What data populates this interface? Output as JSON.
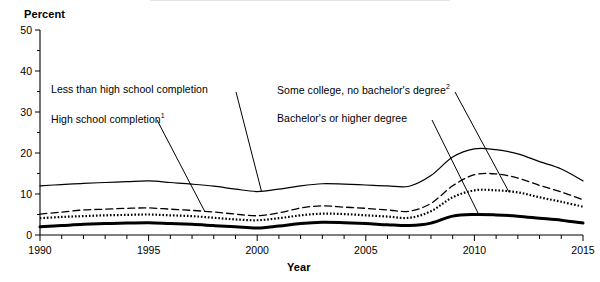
{
  "chart_data": {
    "type": "line",
    "title": "",
    "xlabel": "Year",
    "ylabel": "Percent",
    "ylim": [
      0,
      50
    ],
    "xlim": [
      1990,
      2015
    ],
    "yticks": [
      0,
      10,
      20,
      30,
      40,
      50
    ],
    "ytick_labels": [
      "0",
      "10",
      "20",
      "30",
      "40",
      "50"
    ],
    "yminor_step": 5,
    "xticks": [
      1990,
      1995,
      2000,
      2005,
      2010,
      2015
    ],
    "xtick_labels": [
      "1990",
      "1995",
      "2000",
      "2005",
      "2010",
      "2015"
    ],
    "xtick_step": 1,
    "grid": false,
    "legend": "inline-annotations",
    "x": [
      1990,
      1991,
      1992,
      1993,
      1994,
      1995,
      1996,
      1997,
      1998,
      1999,
      2000,
      2001,
      2002,
      2003,
      2004,
      2005,
      2006,
      2007,
      2008,
      2009,
      2010,
      2011,
      2012,
      2013,
      2014,
      2015
    ],
    "series": [
      {
        "name": "Less than high school completion",
        "style": "solid",
        "values": [
          12.0,
          12.3,
          12.6,
          12.8,
          13.0,
          13.2,
          12.8,
          12.4,
          11.9,
          11.2,
          10.6,
          11.2,
          12.0,
          12.5,
          12.4,
          12.2,
          12.0,
          11.9,
          14.5,
          19.0,
          21.0,
          20.8,
          19.8,
          17.9,
          16.1,
          13.2
        ]
      },
      {
        "name": "High school completion",
        "style": "dashed",
        "values": [
          5.1,
          5.6,
          6.1,
          6.3,
          6.5,
          6.6,
          6.3,
          6.0,
          5.6,
          5.1,
          4.7,
          5.4,
          6.6,
          7.1,
          6.8,
          6.5,
          6.1,
          5.8,
          7.7,
          12.0,
          14.7,
          14.9,
          13.9,
          12.1,
          10.5,
          8.6
        ]
      },
      {
        "name": "Some college, no bachelor's degree",
        "style": "dotted",
        "values": [
          4.1,
          4.4,
          4.6,
          4.8,
          4.9,
          5.0,
          4.8,
          4.6,
          4.2,
          3.8,
          3.6,
          4.1,
          4.8,
          5.2,
          5.1,
          4.8,
          4.5,
          4.2,
          5.8,
          9.2,
          10.9,
          10.9,
          10.4,
          9.2,
          8.1,
          6.9
        ]
      },
      {
        "name": "Bachelor's or higher degree",
        "style": "bold-solid",
        "values": [
          2.0,
          2.3,
          2.6,
          2.8,
          2.9,
          3.0,
          2.8,
          2.6,
          2.3,
          2.0,
          1.7,
          2.2,
          2.8,
          3.1,
          3.0,
          2.8,
          2.5,
          2.3,
          2.9,
          4.6,
          5.0,
          4.9,
          4.6,
          4.1,
          3.6,
          2.9
        ]
      }
    ]
  },
  "labels": {
    "y_axis_title": "Percent",
    "x_axis_title": "Year",
    "less_than_hs": "Less than high school completion",
    "hs_completion": "High school completion",
    "hs_completion_footnote": "1",
    "some_college": "Some college, no bachelor's degree",
    "some_college_footnote": "2",
    "bachelors": "Bachelor's or higher degree"
  },
  "colors": {
    "ink": "#000000",
    "background": "#ffffff"
  }
}
